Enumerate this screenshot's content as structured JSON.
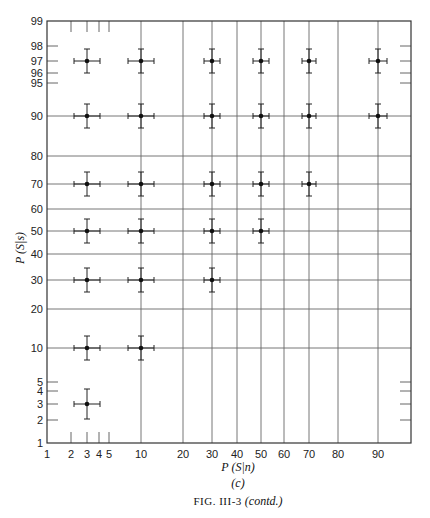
{
  "chart_data": {
    "type": "scatter",
    "title": "",
    "xlabel": "P (S|n)",
    "ylabel": "P (S|s)",
    "subcaption": "(c)",
    "caption": {
      "prefix": "FIG. III-3",
      "suffix": "(contd.)"
    },
    "xscale": "probability (normal-deviate)",
    "yscale": "probability (normal-deviate)",
    "xlim": [
      1,
      99
    ],
    "ylim": [
      1,
      99
    ],
    "grid": true,
    "x_ticks": [
      1,
      2,
      3,
      4,
      5,
      10,
      20,
      30,
      40,
      50,
      60,
      70,
      80,
      90
    ],
    "y_ticks": [
      1,
      2,
      3,
      4,
      5,
      10,
      20,
      30,
      40,
      50,
      60,
      70,
      80,
      90,
      95,
      96,
      97,
      98,
      99
    ],
    "series": [
      {
        "name": "P(S|n)=3",
        "x": 3,
        "y": [
          97,
          90,
          70,
          50,
          30,
          10,
          3
        ]
      },
      {
        "name": "P(S|n)=10",
        "x": 10,
        "y": [
          97,
          90,
          70,
          50,
          30,
          10
        ]
      },
      {
        "name": "P(S|n)=30",
        "x": 30,
        "y": [
          97,
          90,
          70,
          50,
          30
        ]
      },
      {
        "name": "P(S|n)=50",
        "x": 50,
        "y": [
          97,
          90,
          70,
          50
        ]
      },
      {
        "name": "P(S|n)=70",
        "x": 70,
        "y": [
          97,
          90,
          70
        ]
      },
      {
        "name": "P(S|n)=90",
        "x": 90,
        "y": [
          97,
          90
        ]
      }
    ],
    "error_bars": "horizontal and vertical on every point"
  },
  "layout": {
    "x_pos": {
      "1": 47,
      "2": 71,
      "3": 87,
      "4": 99,
      "5": 109,
      "10": 141,
      "20": 183,
      "30": 212,
      "40": 237,
      "50": 261,
      "60": 284,
      "70": 309,
      "80": 338,
      "90": 378,
      "right": 411
    },
    "y_pos": {
      "99": 21,
      "98": 46,
      "97": 61,
      "96": 73,
      "95": 83,
      "90": 116,
      "80": 156,
      "70": 184,
      "60": 209,
      "50": 231,
      "40": 254,
      "30": 280,
      "20": 309,
      "10": 348,
      "5": 382,
      "4": 391,
      "3": 404,
      "2": 420,
      "1": 443
    }
  }
}
